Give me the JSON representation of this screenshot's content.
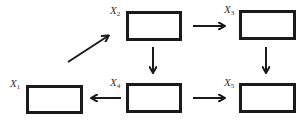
{
  "diagram": {
    "nodes": [
      {
        "id": "x1",
        "label_main": "X",
        "label_sub": "1"
      },
      {
        "id": "x2",
        "label_main": "X",
        "label_sub": "2"
      },
      {
        "id": "x3",
        "label_main": "X",
        "label_sub": "3"
      },
      {
        "id": "x4",
        "label_main": "X",
        "label_sub": "4"
      },
      {
        "id": "x5",
        "label_main": "X",
        "label_sub": "5"
      }
    ],
    "edges": [
      {
        "from": "x1",
        "to": "x2",
        "direction": "diagonal-up-right"
      },
      {
        "from": "x2",
        "to": "x3",
        "direction": "right"
      },
      {
        "from": "x2",
        "to": "x4",
        "direction": "down"
      },
      {
        "from": "x3",
        "to": "x5",
        "direction": "down"
      },
      {
        "from": "x4",
        "to": "x1",
        "direction": "left"
      },
      {
        "from": "x4",
        "to": "x5",
        "direction": "right"
      }
    ],
    "colors": {
      "stroke": "#1a1a1a",
      "label": "#333333",
      "background": "#ffffff"
    }
  }
}
